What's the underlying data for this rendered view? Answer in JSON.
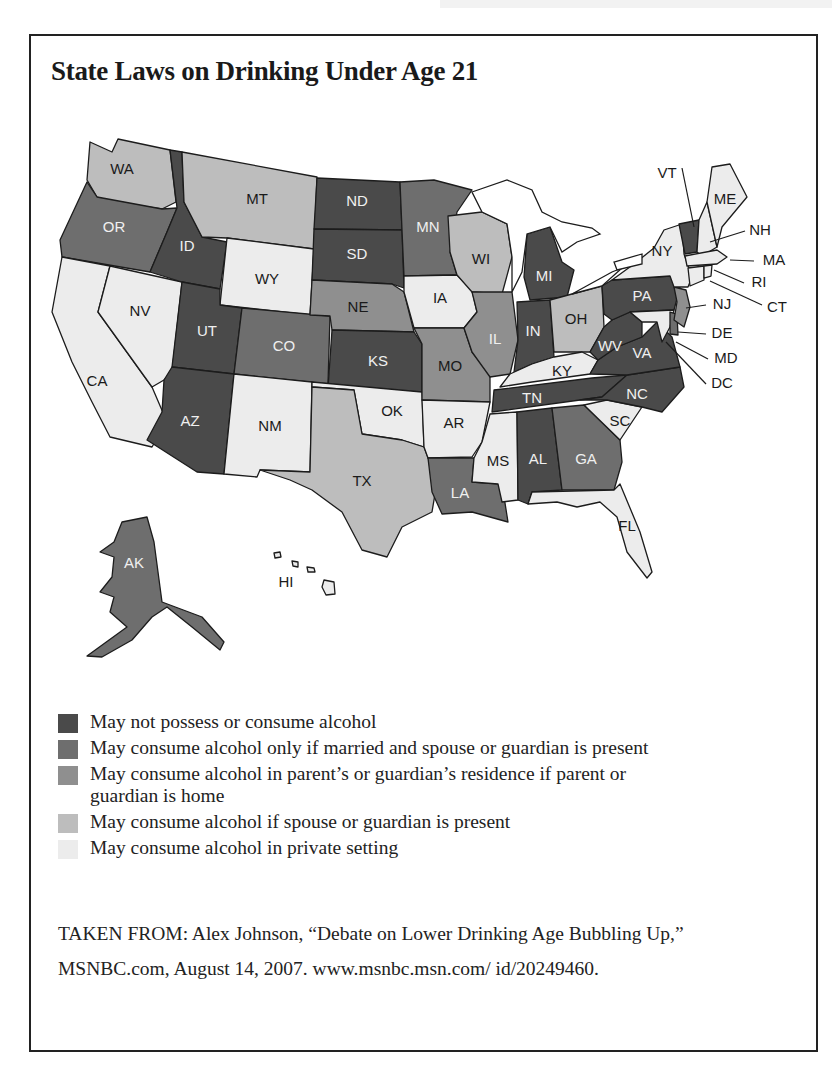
{
  "title": "State Laws on Drinking Under Age 21",
  "colors": {
    "cat1": "#4a4a4a",
    "cat2": "#6e6e6e",
    "cat3": "#8f8f8f",
    "cat4": "#bdbdbd",
    "cat5": "#ececec",
    "border": "#1c1c1c"
  },
  "legend": [
    {
      "key": "cat1",
      "label": "May not possess or consume alcohol"
    },
    {
      "key": "cat2",
      "label": "May consume alcohol only if married and spouse or guardian is present"
    },
    {
      "key": "cat3",
      "label": "May consume alcohol in parent’s or guardian’s residence if parent or guardian is home"
    },
    {
      "key": "cat4",
      "label": "May consume alcohol if spouse or guardian is present"
    },
    {
      "key": "cat5",
      "label": "May consume alcohol in private setting"
    }
  ],
  "states": {
    "WA": "cat4",
    "OR": "cat2",
    "CA": "cat5",
    "NV": "cat5",
    "ID": "cat1",
    "MT": "cat4",
    "WY": "cat5",
    "UT": "cat1",
    "AZ": "cat1",
    "CO": "cat2",
    "NM": "cat5",
    "ND": "cat1",
    "SD": "cat1",
    "NE": "cat3",
    "KS": "cat1",
    "OK": "cat5",
    "TX": "cat4",
    "MN": "cat2",
    "IA": "cat5",
    "MO": "cat3",
    "AR": "cat5",
    "LA": "cat2",
    "WI": "cat4",
    "IL": "cat3",
    "MI": "cat1",
    "IN": "cat1",
    "OH": "cat4",
    "KY": "cat5",
    "TN": "cat1",
    "MS": "cat5",
    "AL": "cat1",
    "GA": "cat2",
    "FL": "cat5",
    "SC": "cat5",
    "NC": "cat1",
    "VA": "cat1",
    "WV": "cat1",
    "PA": "cat1",
    "NY": "cat5",
    "VT": "cat1",
    "NH": "cat5",
    "ME": "cat5",
    "MA": "cat5",
    "RI": "cat5",
    "CT": "cat5",
    "NJ": "cat3",
    "DE": "cat2",
    "MD": "cat5",
    "DC": "cat5",
    "AK": "cat2",
    "HI": "cat5"
  },
  "labels": {
    "WA": "WA",
    "OR": "OR",
    "CA": "CA",
    "NV": "NV",
    "ID": "ID",
    "MT": "MT",
    "WY": "WY",
    "UT": "UT",
    "AZ": "AZ",
    "CO": "CO",
    "NM": "NM",
    "ND": "ND",
    "SD": "SD",
    "NE": "NE",
    "KS": "KS",
    "OK": "OK",
    "TX": "TX",
    "MN": "MN",
    "IA": "IA",
    "MO": "MO",
    "AR": "AR",
    "LA": "LA",
    "WI": "WI",
    "IL": "IL",
    "MI": "MI",
    "IN": "IN",
    "OH": "OH",
    "KY": "KY",
    "TN": "TN",
    "MS": "MS",
    "AL": "AL",
    "GA": "GA",
    "FL": "FL",
    "SC": "SC",
    "NC": "NC",
    "VA": "VA",
    "WV": "WV",
    "PA": "PA",
    "NY": "NY",
    "VT": "VT",
    "NH": "NH",
    "ME": "ME",
    "MA": "MA",
    "RI": "RI",
    "CT": "CT",
    "NJ": "NJ",
    "DE": "DE",
    "MD": "MD",
    "DC": "DC",
    "AK": "AK",
    "HI": "HI"
  },
  "source": "TAKEN FROM: Alex Johnson, “Debate on Lower Drinking Age Bubbling Up,” MSNBC.com, August 14, 2007. www.msnbc.msn.com/ id/20249460.",
  "chart_data": {
    "type": "choropleth",
    "title": "State Laws on Drinking Under Age 21",
    "categories": [
      "May not possess or consume alcohol",
      "May consume alcohol only if married and spouse or guardian is present",
      "May consume alcohol in parent’s or guardian’s residence if parent or guardian is home",
      "May consume alcohol if spouse or guardian is present",
      "May consume alcohol in private setting"
    ],
    "groups": {
      "May not possess or consume alcohol": [
        "ID",
        "UT",
        "AZ",
        "ND",
        "SD",
        "KS",
        "MI",
        "IN",
        "TN",
        "AL",
        "NC",
        "VA",
        "WV",
        "PA",
        "VT"
      ],
      "May consume alcohol only if married and spouse or guardian is present": [
        "OR",
        "CO",
        "MN",
        "LA",
        "GA",
        "DE",
        "AK"
      ],
      "May consume alcohol in parent’s or guardian’s residence if parent or guardian is home": [
        "NE",
        "MO",
        "IL",
        "NJ"
      ],
      "May consume alcohol if spouse or guardian is present": [
        "WA",
        "MT",
        "TX",
        "WI",
        "OH"
      ],
      "May consume alcohol in private setting": [
        "CA",
        "NV",
        "WY",
        "NM",
        "OK",
        "IA",
        "AR",
        "MS",
        "KY",
        "FL",
        "SC",
        "NY",
        "NH",
        "ME",
        "MA",
        "RI",
        "CT",
        "MD",
        "DC",
        "HI"
      ]
    },
    "legend_position": "bottom-left"
  }
}
